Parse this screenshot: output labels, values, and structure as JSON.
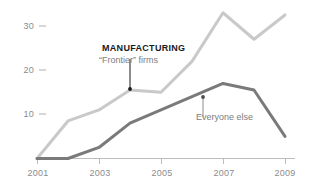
{
  "chart_data": {
    "type": "line",
    "title": "",
    "subtitle": "",
    "xlabel": "",
    "ylabel": "",
    "x": [
      2001,
      2002,
      2003,
      2004,
      2005,
      2006,
      2007,
      2008,
      2009
    ],
    "xlim": [
      2001,
      2009
    ],
    "ylim": [
      0,
      34
    ],
    "grid": false,
    "legend_position": "inline-annotations",
    "x_tick_labels": [
      "2001",
      "2003",
      "2005",
      "2007",
      "2009"
    ],
    "x_tick_values": [
      2001,
      2003,
      2005,
      2007,
      2009
    ],
    "y_tick_labels": [
      "10",
      "20",
      "30"
    ],
    "y_tick_values": [
      10,
      20,
      30
    ],
    "series": [
      {
        "name": "“Frontier” firms",
        "group": "MANUFACTURING",
        "color": "#c9c9c9",
        "values": [
          0,
          8.5,
          11,
          15.5,
          15,
          22,
          33,
          27,
          32.5
        ]
      },
      {
        "name": "Everyone else",
        "color": "#7a7a7a",
        "values": [
          0,
          0,
          2.5,
          8,
          11,
          14,
          17,
          15.5,
          5
        ]
      }
    ],
    "annotations": [
      {
        "id": "frontier",
        "title": "MANUFACTURING",
        "subtitle": "“Frontier” firms",
        "anchor_x": 2004,
        "anchor_y": 15.5
      },
      {
        "id": "everyone-else",
        "title": "",
        "subtitle": "Everyone else",
        "anchor_x": 2006,
        "anchor_y": 14
      }
    ],
    "colors": {
      "frontier_line": "#c9c9c9",
      "everyone_else_line": "#7a7a7a",
      "axis": "#bdbdbd",
      "tick_text": "#8c8c8c",
      "annotation_title": "#1a1a1a",
      "annotation_text": "#7d7d7d",
      "background": "#ffffff"
    }
  },
  "axis": {
    "y_labels": [
      "30",
      "20",
      "10"
    ],
    "x_labels": [
      "2001",
      "2003",
      "2005",
      "2007",
      "2009"
    ]
  },
  "annotations": {
    "manufacturing_title": "MANUFACTURING",
    "manufacturing_sub": "“Frontier” firms",
    "everyone_else": "Everyone else"
  }
}
